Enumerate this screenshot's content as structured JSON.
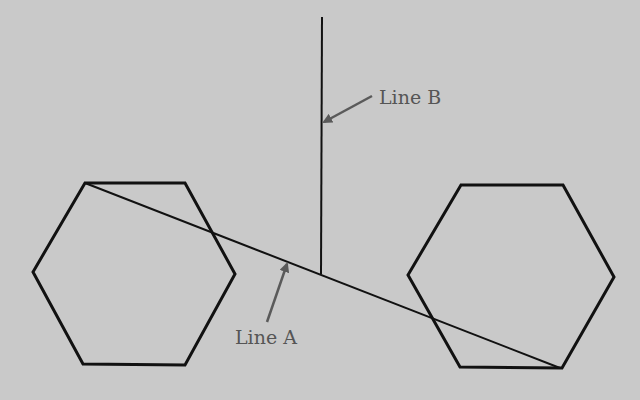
{
  "diagram": {
    "background_color": "#c9c9c9",
    "stroke_color": "#111111",
    "annotation_color": "#5a5a5a",
    "shapes": [
      {
        "id": "hexagon-left",
        "type": "hexagon",
        "points": "85,183 185,183 235,274 185,365 83,364 33,272"
      },
      {
        "id": "hexagon-right",
        "type": "hexagon",
        "points": "461,185 563,185 614,277 562,368 460,367 408,275"
      }
    ],
    "lines": [
      {
        "id": "line-a",
        "label": "Line A",
        "x1": 85,
        "y1": 183,
        "x2": 560,
        "y2": 368
      },
      {
        "id": "line-b",
        "label": "Line B",
        "x1": 322,
        "y1": 17,
        "x2": 321,
        "y2": 274
      }
    ],
    "annotations": [
      {
        "id": "label-line-b",
        "text": "Line B",
        "x": 379,
        "y": 86,
        "arrow_from": [
          372,
          96
        ],
        "arrow_to": [
          324,
          122
        ]
      },
      {
        "id": "label-line-a",
        "text": "Line A",
        "x": 235,
        "y": 326,
        "arrow_from": [
          267,
          322
        ],
        "arrow_to": [
          287,
          264
        ]
      }
    ]
  }
}
